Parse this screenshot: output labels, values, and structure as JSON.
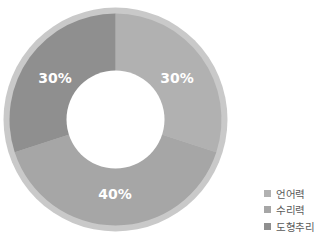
{
  "chart_data": {
    "type": "pie",
    "variant": "donut",
    "title": "",
    "categories": [
      "언어력",
      "수리력",
      "도형추리"
    ],
    "values": [
      30,
      40,
      30
    ],
    "unit": "%",
    "data_labels": [
      "30%",
      "40%",
      "30%"
    ],
    "colors": [
      "#b1b1b1",
      "#a6a6a6",
      "#8f8f8f"
    ],
    "start_angle_deg": 0,
    "direction": "clockwise",
    "legend_position": "bottom-right"
  },
  "donut": {
    "center_x": 115.5,
    "center_y": 119.5,
    "outer_rim_radius": 112,
    "outer_radius": 106,
    "inner_radius": 49,
    "rim_color": "#c9c9c9",
    "hole_color": "#ffffff"
  },
  "labels": {
    "language": "30%",
    "math": "40%",
    "shape": "30%"
  },
  "legend": {
    "items": [
      {
        "label": "언어력",
        "color": "#b1b1b1"
      },
      {
        "label": "수리력",
        "color": "#a6a6a6"
      },
      {
        "label": "도형추리",
        "color": "#8f8f8f"
      }
    ]
  }
}
